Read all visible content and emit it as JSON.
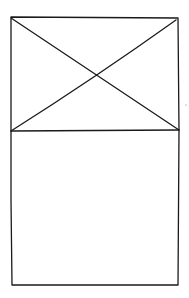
{
  "wireframe": {
    "description": "Hand-drawn card wireframe",
    "stroke_color": "#1a1a1a",
    "background": "#ffffff",
    "outer_frame": {
      "x1": 11,
      "y1": 17,
      "x2": 178,
      "y2": 285
    },
    "image_placeholder": {
      "x1": 11,
      "y1": 17,
      "x2": 178,
      "y2": 131,
      "type": "image-x"
    },
    "content_area": {
      "x1": 11,
      "y1": 131,
      "x2": 178,
      "y2": 285,
      "type": "empty"
    }
  }
}
